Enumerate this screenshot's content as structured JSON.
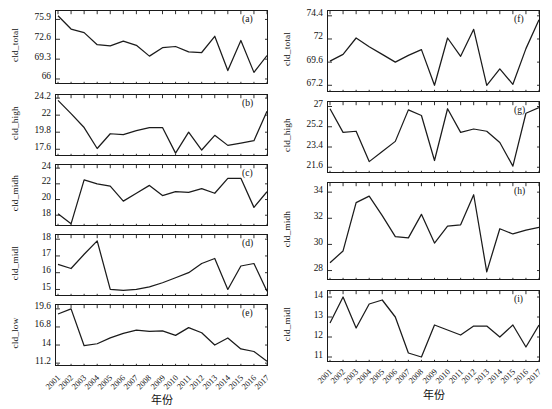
{
  "figure": {
    "width": 552,
    "height": 409,
    "line_color": "#1b1b1b",
    "axis_color": "#1a1a1a",
    "background": "#ffffff",
    "xlabel": "年份",
    "years": [
      2001,
      2002,
      2003,
      2004,
      2005,
      2006,
      2007,
      2008,
      2009,
      2010,
      2011,
      2012,
      2013,
      2014,
      2015,
      2016,
      2017
    ]
  },
  "chart_data": [
    {
      "type": "line",
      "panel": "(a)",
      "column": "left",
      "title": "",
      "xlabel": "年份",
      "ylabel": "cld_total",
      "x": [
        2001,
        2002,
        2003,
        2004,
        2005,
        2006,
        2007,
        2008,
        2009,
        2010,
        2011,
        2012,
        2013,
        2014,
        2015,
        2016,
        2017
      ],
      "values": [
        76.5,
        74.3,
        73.7,
        71.7,
        71.5,
        72.3,
        71.6,
        69.8,
        71.2,
        71.4,
        70.5,
        70.4,
        73.1,
        67.4,
        72.4,
        67.1,
        69.9
      ],
      "yticks": [
        66.0,
        69.3,
        72.6,
        75.9
      ],
      "ylim": [
        65.0,
        77.3
      ],
      "grid": false
    },
    {
      "type": "line",
      "panel": "(b)",
      "column": "left",
      "title": "",
      "xlabel": "年份",
      "ylabel": "cld_high",
      "x": [
        2001,
        2002,
        2003,
        2004,
        2005,
        2006,
        2007,
        2008,
        2009,
        2010,
        2011,
        2012,
        2013,
        2014,
        2015,
        2016,
        2017
      ],
      "values": [
        23.9,
        22.2,
        20.4,
        17.7,
        19.6,
        19.5,
        20.0,
        20.4,
        20.4,
        17.1,
        19.8,
        17.5,
        19.4,
        18.1,
        18.4,
        18.7,
        22.5
      ],
      "yticks": [
        17.6,
        19.8,
        22.0,
        24.2
      ],
      "ylim": [
        16.6,
        24.6
      ],
      "grid": false
    },
    {
      "type": "line",
      "panel": "(c)",
      "column": "left",
      "title": "",
      "xlabel": "年份",
      "ylabel": "cld_midh",
      "x": [
        2001,
        2002,
        2003,
        2004,
        2005,
        2006,
        2007,
        2008,
        2009,
        2010,
        2011,
        2012,
        2013,
        2014,
        2015,
        2016,
        2017
      ],
      "values": [
        18.2,
        16.9,
        22.5,
        22.0,
        21.7,
        19.8,
        20.8,
        21.8,
        20.5,
        21.0,
        20.9,
        21.4,
        20.8,
        22.7,
        22.7,
        19.0,
        21.0
      ],
      "yticks": [
        18,
        20,
        22,
        24
      ],
      "ylim": [
        16.5,
        24.4
      ],
      "grid": false
    },
    {
      "type": "line",
      "panel": "(d)",
      "column": "left",
      "title": "",
      "xlabel": "年份",
      "ylabel": "cld_midl",
      "x": [
        2001,
        2002,
        2003,
        2004,
        2005,
        2006,
        2007,
        2008,
        2009,
        2010,
        2011,
        2012,
        2013,
        2014,
        2015,
        2016,
        2017
      ],
      "values": [
        16.5,
        16.25,
        17.1,
        17.9,
        15.0,
        14.95,
        15.0,
        15.15,
        15.4,
        15.7,
        16.0,
        16.55,
        16.85,
        15.0,
        16.4,
        16.55,
        14.9
      ],
      "yticks": [
        15,
        16,
        17,
        18
      ],
      "ylim": [
        14.55,
        18.25
      ],
      "grid": false
    },
    {
      "type": "line",
      "panel": "(e)",
      "column": "left",
      "title": "",
      "xlabel": "年份",
      "ylabel": "cld_low",
      "x": [
        2001,
        2002,
        2003,
        2004,
        2005,
        2006,
        2007,
        2008,
        2009,
        2010,
        2011,
        2012,
        2013,
        2014,
        2015,
        2016,
        2017
      ],
      "values": [
        18.8,
        19.6,
        13.9,
        14.2,
        15.1,
        15.8,
        16.3,
        16.1,
        16.2,
        15.5,
        16.7,
        15.9,
        14.0,
        15.1,
        13.4,
        13.0,
        11.5
      ],
      "yticks": [
        11.2,
        14.0,
        16.8,
        19.6
      ],
      "ylim": [
        10.6,
        20.2
      ],
      "grid": false
    },
    {
      "type": "line",
      "panel": "(f)",
      "column": "right",
      "title": "",
      "xlabel": "年份",
      "ylabel": "cld_total",
      "x": [
        2001,
        2002,
        2003,
        2004,
        2005,
        2006,
        2007,
        2008,
        2009,
        2010,
        2011,
        2012,
        2013,
        2014,
        2015,
        2016,
        2017
      ],
      "values": [
        69.7,
        70.4,
        72.1,
        71.2,
        70.4,
        69.6,
        70.3,
        70.9,
        67.2,
        72.1,
        70.2,
        73.0,
        67.2,
        68.9,
        67.3,
        71.0,
        74.0
      ],
      "yticks": [
        67.2,
        69.6,
        72.0,
        74.4
      ],
      "ylim": [
        66.4,
        74.9
      ],
      "grid": false
    },
    {
      "type": "line",
      "panel": "(g)",
      "column": "right",
      "title": "",
      "xlabel": "年份",
      "ylabel": "cld_high",
      "x": [
        2001,
        2002,
        2003,
        2004,
        2005,
        2006,
        2007,
        2008,
        2009,
        2010,
        2011,
        2012,
        2013,
        2014,
        2015,
        2016,
        2017
      ],
      "values": [
        26.8,
        24.7,
        24.8,
        22.1,
        23.0,
        23.9,
        26.7,
        26.2,
        22.2,
        26.8,
        24.7,
        25.0,
        24.8,
        23.8,
        21.7,
        26.4,
        26.9
      ],
      "yticks": [
        21.6,
        23.4,
        25.2,
        27.0
      ],
      "ylim": [
        21.0,
        27.4
      ],
      "grid": false
    },
    {
      "type": "line",
      "panel": "(h)",
      "column": "right",
      "title": "",
      "xlabel": "年份",
      "ylabel": "cld_midh",
      "x": [
        2001,
        2002,
        2003,
        2004,
        2005,
        2006,
        2007,
        2008,
        2009,
        2010,
        2011,
        2012,
        2013,
        2014,
        2015,
        2016,
        2017
      ],
      "values": [
        28.6,
        29.5,
        33.2,
        33.7,
        32.2,
        30.6,
        30.5,
        32.3,
        30.1,
        31.4,
        31.5,
        33.8,
        27.9,
        31.2,
        30.8,
        31.1,
        31.3
      ],
      "yticks": [
        28,
        30,
        32,
        34
      ],
      "ylim": [
        27.2,
        34.7
      ],
      "grid": false
    },
    {
      "type": "line",
      "panel": "(i)",
      "column": "right",
      "title": "",
      "xlabel": "年份",
      "ylabel": "cld_midl",
      "x": [
        2001,
        2002,
        2003,
        2004,
        2005,
        2006,
        2007,
        2008,
        2009,
        2010,
        2011,
        2012,
        2013,
        2014,
        2015,
        2016,
        2017
      ],
      "values": [
        12.7,
        14.0,
        12.45,
        13.65,
        13.85,
        13.0,
        11.2,
        11.0,
        12.6,
        12.35,
        12.1,
        12.55,
        12.55,
        12.0,
        12.6,
        11.5,
        12.6
      ],
      "yticks": [
        11,
        12,
        13,
        14
      ],
      "ylim": [
        10.7,
        14.3
      ],
      "grid": false
    }
  ]
}
